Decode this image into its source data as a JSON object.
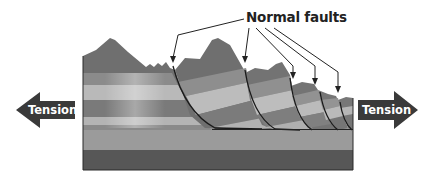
{
  "labels": {
    "faults": "Normal faults",
    "tension_left": "Tension",
    "tension_right": "Tension"
  },
  "colors": {
    "arrow_fill": "#3a3a3a",
    "outline": "#1a1a1a",
    "peak_dark": "#6e6e6e",
    "band_mid": "#8a8a8a",
    "band_light": "#b5b5b5",
    "band_dark": "#777777",
    "base_light": "#9e9e9e",
    "base_dark": "#585858"
  },
  "diagram": {
    "type": "cross-section",
    "fault_count": 5,
    "tension_arrows": [
      "left",
      "right"
    ]
  }
}
